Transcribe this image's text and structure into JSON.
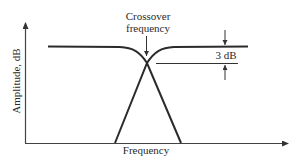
{
  "diagram": {
    "axes": {
      "x_label": "Frequency",
      "y_label": "Amplitude, dB"
    },
    "annotations": {
      "crossover_line1": "Crossover",
      "crossover_line2": "frequency",
      "attenuation_label": "3 dB"
    },
    "curves": [
      {
        "name": "low-pass response",
        "description": "flat at top, rolls off past crossover"
      },
      {
        "name": "high-pass response",
        "description": "rises from low frequency, flat at top after crossover"
      }
    ],
    "colors": {
      "line": "#2b2b2b",
      "axis": "#444444",
      "background": "#ffffff"
    }
  }
}
